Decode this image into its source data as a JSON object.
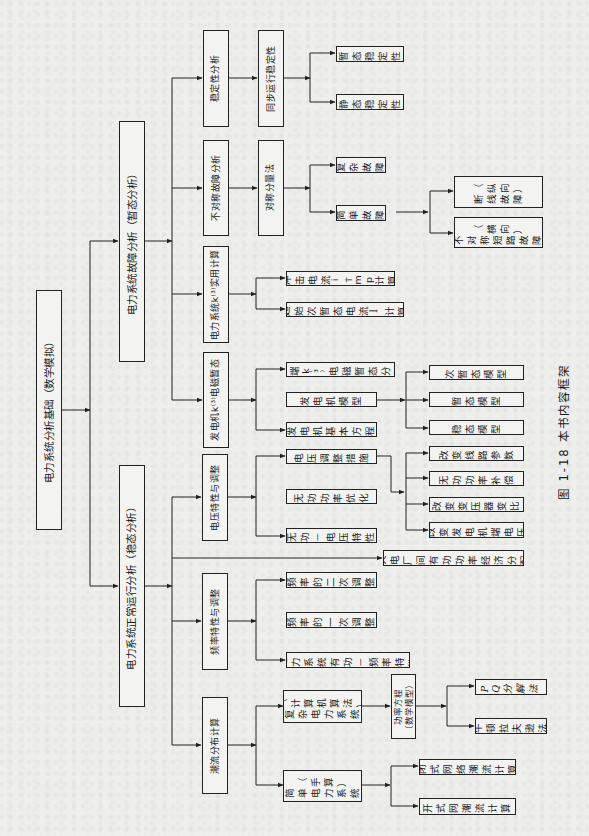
{
  "diagram": {
    "caption": "图 1-18   本书内容框架",
    "root": {
      "label": "电力系统分析基础（数学模拟）"
    },
    "level1": {
      "transient": "电力系统故障分析（暂态分析）",
      "steady": "电力系统正常运行分析（稳态分析）"
    },
    "level2": {
      "stability": "稳定性分析",
      "asym_fault": "不对称故障分析",
      "practical_calc": "电力系统k⁽³⁾实用计算",
      "em_transient": "发电机k⁽³⁾电磁暂态",
      "voltage": "电压特性与调整",
      "frequency": "频率特性与调整",
      "power_flow": "潮流分布计算"
    },
    "level3": {
      "sync_stability": "同步运行稳定性",
      "sym_component": "对称分量法",
      "transient_stability": "暂态稳定性",
      "static_stability": "静态稳定性",
      "complex_fault": "复杂故障",
      "simple_fault": "简单故障",
      "open_line_fault": [
        "（纵向）",
        "断线故障"
      ],
      "short_circuit_fault": [
        "（横向）",
        "不对称短路故障"
      ],
      "impulse_current": "冲击电流 i_imp 计算",
      "initial_current": "起始次暂态电流 I″ 计算",
      "machine_end": "机端 k⁽³⁾ 电磁暂态分析",
      "gen_model": "发电机模型",
      "gen_equation": "发电机基本方程",
      "subtransient_model": "次暂态模型",
      "transient_model": "暂态模型",
      "steady_model": "稳态模型",
      "voltage_measures": "电压调整措施",
      "reactive_opt": "无功功率优化",
      "reactive_voltage": "无功－电压特性",
      "change_line": "改变线路参数",
      "reactive_comp": "无功功率补偿",
      "change_ratio": "改变变压器变比",
      "change_gen_v": "改变发电机端电压",
      "thermal_dispatch": "火电厂间有功功率经济分配",
      "secondary_reg": "频率的二次调整",
      "primary_reg": "频率的一次调整",
      "active_freq": "电力系统有功－频率特性",
      "complex_system": [
        "（计算机算法）",
        "复杂电力系统"
      ],
      "flow_equation": [
        "功率方程",
        "（数学模型）"
      ],
      "pq_method": "PQ分解法",
      "newton_method": "牛顿拉夫逊法",
      "simple_system": [
        "（手算）",
        "简单电力系统"
      ],
      "closed_net": "闭式网络潮流计算",
      "open_net": "开式网潮流计算"
    }
  },
  "colors": {
    "line": "#222222",
    "background": "#eeeeec",
    "box_fill": "#f3f3f1"
  }
}
